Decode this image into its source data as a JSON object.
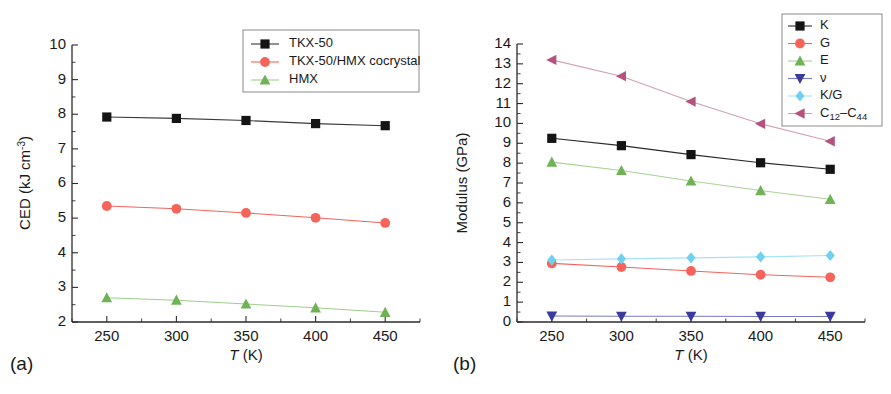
{
  "figure": {
    "panel_a_label": "(a)",
    "panel_b_label": "(b)",
    "xlabel_italic": "T",
    "xlabel_unit": "(K)"
  },
  "chart_data": [
    {
      "type": "line",
      "panel": "(a)",
      "title": "",
      "xlabel": "T (K)",
      "ylabel": "CED (kJ cm-3)",
      "ylabel_main": "CED (kJ cm",
      "ylabel_sup": "-3",
      "ylabel_tail": ")",
      "x": [
        250,
        300,
        350,
        400,
        450
      ],
      "xlim": [
        225,
        475
      ],
      "ylim": [
        2,
        10
      ],
      "xticks": [
        250,
        300,
        350,
        400,
        450
      ],
      "yticks": [
        2,
        3,
        4,
        5,
        6,
        7,
        8,
        9,
        10
      ],
      "grid": false,
      "legend_position": "top-right",
      "series": [
        {
          "name": "TKX-50",
          "marker": "square",
          "color": "#141414",
          "line_color": "#3a3a3a",
          "values": [
            7.92,
            7.88,
            7.82,
            7.73,
            7.67
          ]
        },
        {
          "name": "TKX-50/HMX cocrystal",
          "marker": "circle",
          "color": "#f4645a",
          "line_color": "#f4645a",
          "values": [
            5.35,
            5.27,
            5.15,
            5.01,
            4.86
          ]
        },
        {
          "name": "HMX",
          "marker": "triangle-up",
          "color": "#6fb356",
          "line_color": "#9fcf8c",
          "values": [
            2.7,
            2.63,
            2.52,
            2.41,
            2.28
          ]
        }
      ]
    },
    {
      "type": "line",
      "panel": "(b)",
      "title": "",
      "xlabel": "T (K)",
      "ylabel": "Modulus (GPa)",
      "x": [
        250,
        300,
        350,
        400,
        450
      ],
      "xlim": [
        225,
        475
      ],
      "ylim": [
        0,
        14
      ],
      "xticks": [
        250,
        300,
        350,
        400,
        450
      ],
      "yticks": [
        0,
        1,
        2,
        3,
        4,
        5,
        6,
        7,
        8,
        9,
        10,
        11,
        12,
        13,
        14
      ],
      "grid": false,
      "legend_position": "top-right",
      "series": [
        {
          "name": "K",
          "marker": "square",
          "color": "#141414",
          "line_color": "#2a2a2a",
          "values": [
            9.25,
            8.88,
            8.43,
            8.02,
            7.69
          ]
        },
        {
          "name": "G",
          "marker": "circle",
          "color": "#f4645a",
          "line_color": "#f4645a",
          "values": [
            2.95,
            2.77,
            2.57,
            2.38,
            2.25
          ]
        },
        {
          "name": "E",
          "marker": "triangle-up",
          "color": "#6fb356",
          "line_color": "#a8d394",
          "values": [
            8.05,
            7.63,
            7.1,
            6.62,
            6.18
          ]
        },
        {
          "name": "ν",
          "marker": "triangle-down",
          "color": "#3b3b9e",
          "line_color": "#7a7ac4",
          "values": [
            0.3,
            0.29,
            0.29,
            0.28,
            0.28
          ]
        },
        {
          "name": "K/G",
          "marker": "diamond",
          "color": "#6fd0f0",
          "line_color": "#a6e2f7",
          "values": [
            3.12,
            3.18,
            3.23,
            3.28,
            3.35
          ]
        },
        {
          "name": "C12-C44",
          "name_main": "C",
          "name_sub1": "12",
          "name_dash": "–C",
          "name_sub2": "44",
          "marker": "triangle-left",
          "color": "#b4537f",
          "line_color": "#d0a0b8",
          "values": [
            13.2,
            12.38,
            11.1,
            9.98,
            9.1
          ]
        }
      ]
    }
  ]
}
